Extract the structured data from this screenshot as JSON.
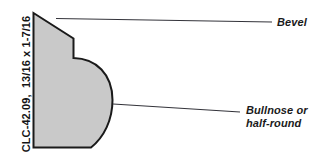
{
  "figure": {
    "type": "molding-profile-diagram",
    "background_color": "#ffffff",
    "profile": {
      "name": "molding-cross-section",
      "fill_color": "#c9c9c9",
      "stroke_color": "#1a1a1a",
      "features": [
        "bevel",
        "step",
        "bullnose"
      ]
    },
    "spec_text": "CLC-42.09,  13/16 x 1-7/16",
    "callouts": [
      {
        "id": "bevel",
        "label": "Bevel",
        "leader_from": [
          56,
          19
        ],
        "leader_to": [
          272,
          22
        ]
      },
      {
        "id": "bullnose",
        "label_line_1": "Bullnose or",
        "label_line_2": "half-round",
        "leader_from": [
          113,
          104
        ],
        "leader_to": [
          240,
          112
        ]
      }
    ],
    "colors": {
      "fill": "#c9c9c9",
      "outline": "#1a1a1a",
      "leader": "#33333a",
      "text": "#141414"
    }
  }
}
